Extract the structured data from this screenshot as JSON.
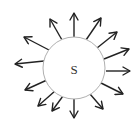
{
  "diagram": {
    "pole": {
      "label": "S",
      "cx": 74,
      "cy": 68,
      "r": 31,
      "stroke": "#b0b0b0"
    },
    "arrow_color": "#222222",
    "arrows": [
      {
        "x1": 74,
        "y1": 37,
        "x2": 74,
        "y2": 13
      },
      {
        "x1": 86,
        "y1": 40,
        "x2": 101,
        "y2": 18
      },
      {
        "x1": 97,
        "y1": 48,
        "x2": 117,
        "y2": 32
      },
      {
        "x1": 104,
        "y1": 59,
        "x2": 129,
        "y2": 49
      },
      {
        "x1": 106,
        "y1": 71,
        "x2": 130,
        "y2": 71
      },
      {
        "x1": 101,
        "y1": 83,
        "x2": 123,
        "y2": 94
      },
      {
        "x1": 90,
        "y1": 94,
        "x2": 103,
        "y2": 109
      },
      {
        "x1": 74,
        "y1": 98,
        "x2": 74,
        "y2": 118
      },
      {
        "x1": 63,
        "y1": 96,
        "x2": 52,
        "y2": 111
      },
      {
        "x1": 55,
        "y1": 91,
        "x2": 38,
        "y2": 106
      },
      {
        "x1": 47,
        "y1": 80,
        "x2": 25,
        "y2": 90
      },
      {
        "x1": 44,
        "y1": 61,
        "x2": 15,
        "y2": 64
      },
      {
        "x1": 49,
        "y1": 50,
        "x2": 24,
        "y2": 37
      },
      {
        "x1": 62,
        "y1": 40,
        "x2": 50,
        "y2": 19
      }
    ]
  }
}
